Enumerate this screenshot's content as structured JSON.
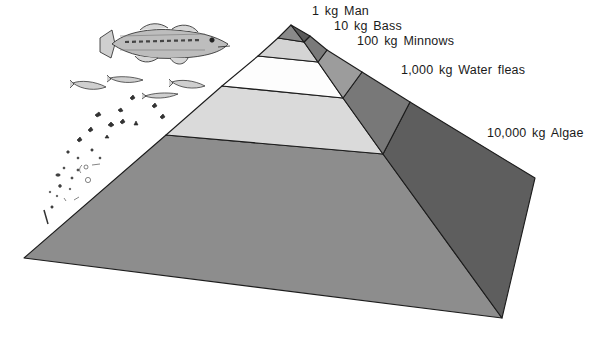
{
  "diagram": {
    "type": "pyramid",
    "levels": [
      {
        "label": "1 kg Man",
        "mass": "1 kg",
        "organism": "Man",
        "front_color": "#8a8a8a",
        "side_color": "#5a5a5a"
      },
      {
        "label": "10 kg Bass",
        "mass": "10 kg",
        "organism": "Bass",
        "front_color": "#d4d4d4",
        "side_color": "#7a7a7a"
      },
      {
        "label": "100 kg Minnows",
        "mass": "100 kg",
        "organism": "Minnows",
        "front_color": "#fdfdfd",
        "side_color": "#9c9c9c"
      },
      {
        "label": "1,000 kg Water fleas",
        "mass": "1,000 kg",
        "organism": "Water fleas",
        "front_color": "#dadada",
        "side_color": "#787878"
      },
      {
        "label": "10,000 kg Algae",
        "mass": "10,000 kg",
        "organism": "Algae",
        "front_color": "#8d8d8d",
        "side_color": "#5e5e5e"
      }
    ],
    "illustrations": [
      "largemouth bass",
      "minnows",
      "water fleas",
      "algae"
    ]
  }
}
